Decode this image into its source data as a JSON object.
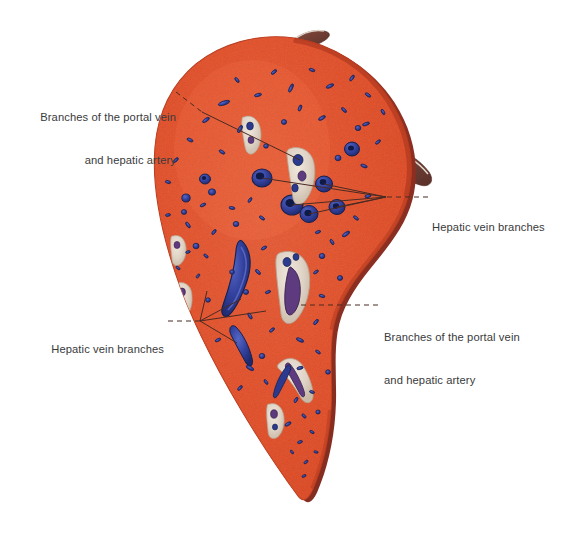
{
  "figure": {
    "organ": "liver",
    "view": "cut surface of liver with peeled capsule flaps",
    "background_color": "#ffffff"
  },
  "colors": {
    "parenchyma": "#e8512b",
    "parenchyma_light": "#f06a44",
    "parenchyma_dark": "#c9391c",
    "capsule_rim": "#9b3526",
    "capsule_flap": "#7d4238",
    "capsule_flap_edge": "#d8cfc6",
    "vessel_blue": "#2b3a8f",
    "vessel_blue_light": "#4a5bbf",
    "vessel_purple": "#5e3a7e",
    "portal_triad_pale": "#e7ded3",
    "label_text": "#3a3a3c",
    "leader_line": "#4a2a22"
  },
  "labels": [
    {
      "id": "portal-upper-left",
      "lines": [
        "Branches of the portal vein",
        "and hepatic artery"
      ],
      "align": "right",
      "x": 28,
      "y": 82,
      "describes": "branches of the portal vein and hepatic artery"
    },
    {
      "id": "hepatic-right",
      "lines": [
        "Hepatic vein branches"
      ],
      "align": "left",
      "x": 432,
      "y": 192,
      "describes": "hepatic vein branches"
    },
    {
      "id": "hepatic-lower-left",
      "lines": [
        "Hepatic vein branches"
      ],
      "align": "right",
      "x": 40,
      "y": 314,
      "describes": "hepatic vein branches"
    },
    {
      "id": "portal-lower-right",
      "lines": [
        "Branches of the portal vein",
        "and hepatic artery"
      ],
      "align": "left",
      "x": 384,
      "y": 302,
      "describes": "branches of the portal vein and hepatic artery"
    }
  ],
  "leader_groups": [
    {
      "id": "leader-portal-upper-left",
      "style": "dashed-then-solid",
      "from": {
        "x": 176,
        "y": 92
      },
      "hinge": {
        "x": 202,
        "y": 112
      },
      "targets": [
        {
          "x": 300,
          "y": 160
        }
      ]
    },
    {
      "id": "leader-hepatic-right",
      "style": "dashed-then-fan",
      "from": {
        "x": 428,
        "y": 197
      },
      "hub": {
        "x": 386,
        "y": 197
      },
      "targets": [
        {
          "x": 262,
          "y": 178
        },
        {
          "x": 292,
          "y": 205
        },
        {
          "x": 324,
          "y": 184
        },
        {
          "x": 309,
          "y": 214
        },
        {
          "x": 337,
          "y": 207
        }
      ]
    },
    {
      "id": "leader-hepatic-lower-left",
      "style": "dashed-then-fan",
      "from": {
        "x": 168,
        "y": 321
      },
      "hub": {
        "x": 200,
        "y": 321
      },
      "targets": [
        {
          "x": 207,
          "y": 291
        },
        {
          "x": 241,
          "y": 299
        },
        {
          "x": 266,
          "y": 311
        },
        {
          "x": 237,
          "y": 343
        }
      ]
    },
    {
      "id": "leader-portal-lower-right",
      "style": "dashed",
      "from": {
        "x": 378,
        "y": 305
      },
      "targets": [
        {
          "x": 300,
          "y": 305
        }
      ]
    }
  ],
  "vessel_counts": {
    "large_hepatic_veins": 8,
    "portal_triads": 9,
    "small_vessels": 60
  }
}
